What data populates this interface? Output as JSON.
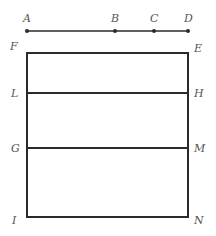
{
  "diagram": {
    "colors": {
      "stroke": "#2a2a2a",
      "label": "#555555",
      "background": "#ffffff"
    },
    "segment": {
      "points": [
        {
          "label": "A",
          "x": 27,
          "y": 31
        },
        {
          "label": "B",
          "x": 115,
          "y": 31
        },
        {
          "label": "C",
          "x": 154,
          "y": 31
        },
        {
          "label": "D",
          "x": 188,
          "y": 31
        }
      ]
    },
    "rectangle": {
      "corners": {
        "top_left": "F",
        "top_right": "E",
        "bottom_left": "I",
        "bottom_right": "N"
      },
      "x": 27,
      "y": 53,
      "width": 161,
      "height": 164
    },
    "dividers": [
      {
        "left": "L",
        "right": "H",
        "y": 93
      },
      {
        "left": "G",
        "right": "M",
        "y": 148
      }
    ]
  }
}
